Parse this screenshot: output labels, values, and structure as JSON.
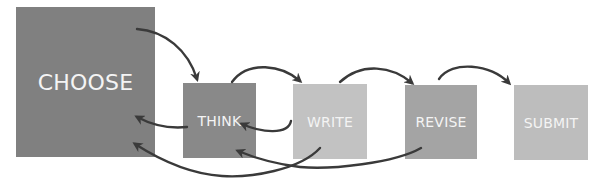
{
  "diagram": {
    "type": "process-flow",
    "nodes": [
      {
        "id": "choose",
        "label": "CHOOSE",
        "color": "#808080"
      },
      {
        "id": "think",
        "label": "THINK",
        "color": "#898989"
      },
      {
        "id": "write",
        "label": "WRITE",
        "color": "#c2c2c2"
      },
      {
        "id": "revise",
        "label": "REVISE",
        "color": "#a4a4a4"
      },
      {
        "id": "submit",
        "label": "SUBMIT",
        "color": "#bdbdbd"
      }
    ],
    "edges": [
      {
        "from": "choose",
        "to": "think",
        "direction": "forward"
      },
      {
        "from": "think",
        "to": "write",
        "direction": "forward"
      },
      {
        "from": "write",
        "to": "revise",
        "direction": "forward"
      },
      {
        "from": "revise",
        "to": "submit",
        "direction": "forward"
      },
      {
        "from": "think",
        "to": "choose",
        "direction": "back"
      },
      {
        "from": "write",
        "to": "think",
        "direction": "back"
      },
      {
        "from": "write",
        "to": "choose",
        "direction": "back"
      },
      {
        "from": "revise",
        "to": "think",
        "direction": "back"
      }
    ],
    "arrow_color": "#3a3a3a"
  }
}
